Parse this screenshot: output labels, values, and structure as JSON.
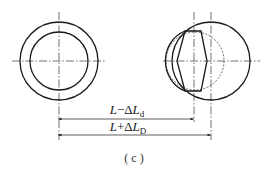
{
  "figure": {
    "caption": "( c )",
    "stroke_color": "#1a1a1a",
    "left_view": {
      "center": [
        59,
        61
      ],
      "outer_radius": 39,
      "inner_radius": 29
    },
    "right_view": {
      "outer_circle_center": [
        211,
        61
      ],
      "outer_radius": 39,
      "dashed_circle_center": [
        195,
        61
      ],
      "dashed_radius": 29
    },
    "dimensions": [
      {
        "id": "dim-d",
        "base": "L−ΔL",
        "subscript": "d",
        "from_x": 58,
        "to_x": 194,
        "y": 119
      },
      {
        "id": "dim-D",
        "base": "L+ΔL",
        "subscript": "D",
        "from_x": 58,
        "to_x": 211,
        "y": 135
      }
    ]
  }
}
